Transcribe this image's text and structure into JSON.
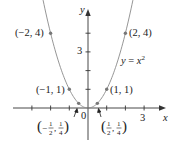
{
  "figure": {
    "type": "function-graph",
    "function_label": "y = x²",
    "function_label_parts": {
      "y": "y",
      "eq": " = ",
      "x": "x",
      "exp": "2"
    },
    "axes": {
      "x_label": "x",
      "y_label": "y",
      "origin_label": "0",
      "x_tick_label": "3",
      "y_tick_label": "3",
      "x_ticks": [
        -3,
        -2,
        -1,
        1,
        2,
        3
      ],
      "y_ticks": [
        1,
        2,
        3,
        4
      ]
    },
    "points": [
      {
        "x": -2,
        "y": 4,
        "label": "(−2, 4)"
      },
      {
        "x": 2,
        "y": 4,
        "label": "(2, 4)"
      },
      {
        "x": -1,
        "y": 1,
        "label": "(−1, 1)"
      },
      {
        "x": 1,
        "y": 1,
        "label": "(1, 1)"
      },
      {
        "x": -0.5,
        "y": 0.25,
        "label": "(−½, ¼)"
      },
      {
        "x": 0.5,
        "y": 0.25,
        "label": "(½, ¼)"
      }
    ],
    "colors": {
      "curve": "#8a8a8a",
      "axes": "#333333",
      "points": "#777777",
      "text": "#222222"
    }
  },
  "chart_data": {
    "type": "line",
    "xlabel": "x",
    "ylabel": "y",
    "series": [
      {
        "name": "y = x^2",
        "x": [
          -2,
          -1.5,
          -1,
          -0.5,
          0,
          0.5,
          1,
          1.5,
          2
        ],
        "values": [
          4,
          2.25,
          1,
          0.25,
          0,
          0.25,
          1,
          2.25,
          4
        ]
      }
    ],
    "labeled_points": [
      [
        -2,
        4
      ],
      [
        2,
        4
      ],
      [
        -1,
        1
      ],
      [
        1,
        1
      ],
      [
        -0.5,
        0.25
      ],
      [
        0.5,
        0.25
      ]
    ],
    "xlim": [
      -4,
      4
    ],
    "ylim": [
      -2,
      5
    ],
    "grid": false
  }
}
